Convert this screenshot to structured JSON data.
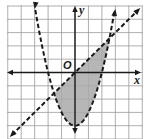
{
  "chart_data": {
    "type": "line",
    "title": "",
    "xlabel": "x",
    "ylabel": "y",
    "origin_label": "O",
    "xlim": [
      -5,
      5
    ],
    "ylim": [
      -5,
      5
    ],
    "grid": true,
    "grid_step": 1,
    "legend": null,
    "series": [
      {
        "name": "parabola",
        "equation": "y = x^2 - 4",
        "style": "dashed",
        "x": [
          -3,
          -2,
          -1,
          0,
          1,
          2,
          3
        ],
        "y": [
          5,
          0,
          -3,
          -4,
          -3,
          0,
          5
        ],
        "vertex": [
          0,
          -4
        ],
        "x_intercepts": [
          -2,
          2
        ],
        "arrows": "both ends"
      },
      {
        "name": "line",
        "equation": "y = x",
        "style": "dashed",
        "x": [
          -5,
          0,
          5
        ],
        "y": [
          -5,
          0,
          5
        ],
        "arrows": "both ends"
      }
    ],
    "shaded_region": {
      "description": "Region between the line and parabola: y > x^2 - 4 and y < x",
      "inequalities": [
        "y > x^2 - 4",
        "y < x"
      ],
      "intersections": [
        [
          -1.56,
          -1.56
        ],
        [
          2.56,
          2.56
        ]
      ],
      "color": "#a9a9a9"
    }
  },
  "labels": {
    "x_axis": "x",
    "y_axis": "y",
    "origin": "O"
  },
  "colors": {
    "shade": "#a9a9a9",
    "curve": "#1a1a1a",
    "grid": "#9a9a9a"
  }
}
